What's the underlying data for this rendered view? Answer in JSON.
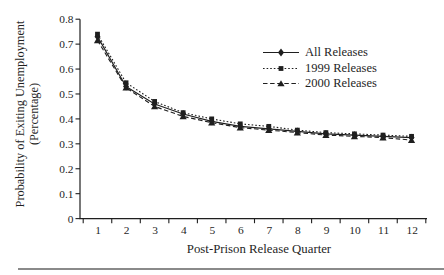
{
  "page": {
    "background_color": "#ffffff",
    "divider_color": "#8a8a8a",
    "text_color": "#1f1f1f"
  },
  "chart_data": {
    "type": "line",
    "title": "",
    "xlabel": "Post-Prison Release Quarter",
    "ylabel": "Probability of Exiting Unemployment (Percentage)",
    "ylabel_lines": [
      "Probability of Exiting Unemployment",
      "(Percentage)"
    ],
    "x": [
      1,
      2,
      3,
      4,
      5,
      6,
      7,
      8,
      9,
      10,
      11,
      12
    ],
    "x_tick_labels": [
      "1",
      "2",
      "3",
      "4",
      "5",
      "6",
      "7",
      "8",
      "9",
      "10",
      "11",
      "12"
    ],
    "y_tick_labels": [
      "0",
      "0.1",
      "0.2",
      "0.3",
      "0.4",
      "0.5",
      "0.6",
      "0.7",
      "0.8"
    ],
    "ylim": [
      0,
      0.8
    ],
    "y_tick_step": 0.1,
    "grid": false,
    "legend_position": "upper-right-inside",
    "axis_color": "#1f1f1f",
    "series": [
      {
        "name": "All Releases",
        "marker": "diamond",
        "line_style": "solid",
        "color": "#1f1f1f",
        "values": [
          0.73,
          0.53,
          0.46,
          0.42,
          0.39,
          0.37,
          0.36,
          0.35,
          0.34,
          0.335,
          0.33,
          0.325
        ]
      },
      {
        "name": "1999 Releases",
        "marker": "square",
        "line_style": "dotted",
        "color": "#1f1f1f",
        "values": [
          0.74,
          0.545,
          0.47,
          0.425,
          0.4,
          0.38,
          0.37,
          0.355,
          0.345,
          0.34,
          0.335,
          0.33
        ]
      },
      {
        "name": "2000 Releases",
        "marker": "triangle",
        "line_style": "dashed",
        "color": "#1f1f1f",
        "values": [
          0.715,
          0.525,
          0.45,
          0.41,
          0.385,
          0.365,
          0.355,
          0.345,
          0.335,
          0.33,
          0.325,
          0.315
        ]
      }
    ]
  }
}
